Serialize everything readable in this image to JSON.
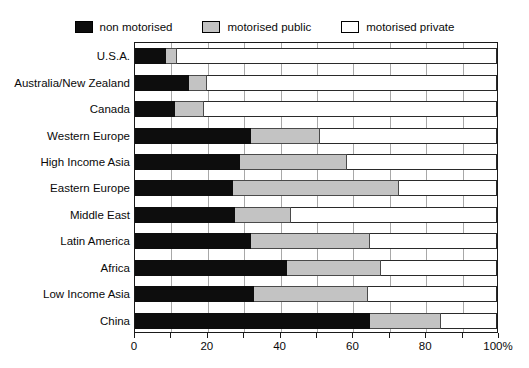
{
  "chart_data": {
    "type": "bar",
    "orientation": "horizontal",
    "stacked": true,
    "normalized_percent": true,
    "title": "",
    "subtitle": "",
    "xlabel": "",
    "ylabel": "",
    "xlim": [
      0,
      100
    ],
    "xtick_values": [
      0,
      10,
      20,
      30,
      40,
      50,
      60,
      70,
      80,
      90,
      100
    ],
    "xtick_labels": [
      "0",
      "",
      "20",
      "",
      "40",
      "",
      "60",
      "",
      "80",
      "",
      "100%"
    ],
    "grid": true,
    "grid_axis": "x",
    "legend_position": "top-center",
    "categories": [
      "U.S.A.",
      "Australia/New Zealand",
      "Canada",
      "Western Europe",
      "High Income Asia",
      "Eastern Europe",
      "Middle East",
      "Latin America",
      "Africa",
      "Low Income Asia",
      "China"
    ],
    "series": [
      {
        "name": "non motorised",
        "color": "#0d0d0d",
        "values": [
          8.5,
          15,
          11,
          32,
          29,
          27,
          27.5,
          32,
          42,
          33,
          65
        ]
      },
      {
        "name": "motorised public",
        "color": "#c3c3c3",
        "values": [
          3,
          5,
          8,
          19,
          29.5,
          46,
          15.5,
          33,
          26,
          31.5,
          19.5
        ]
      },
      {
        "name": "motorised private",
        "color": "#ffffff",
        "values": [
          88.5,
          80,
          81,
          49,
          41.5,
          27,
          57,
          35,
          32,
          35.5,
          15.5
        ]
      }
    ],
    "cumulative_stops": [
      {
        "category": "U.S.A.",
        "non_motorised_end": 8.5,
        "motorised_public_end": 11.5,
        "total": 100
      },
      {
        "category": "Australia/New Zealand",
        "non_motorised_end": 15,
        "motorised_public_end": 20,
        "total": 100
      },
      {
        "category": "Canada",
        "non_motorised_end": 11,
        "motorised_public_end": 19,
        "total": 100
      },
      {
        "category": "Western Europe",
        "non_motorised_end": 32,
        "motorised_public_end": 51,
        "total": 100
      },
      {
        "category": "High Income Asia",
        "non_motorised_end": 29,
        "motorised_public_end": 58.5,
        "total": 100
      },
      {
        "category": "Eastern Europe",
        "non_motorised_end": 27,
        "motorised_public_end": 73,
        "total": 100
      },
      {
        "category": "Middle East",
        "non_motorised_end": 27.5,
        "motorised_public_end": 43,
        "total": 100
      },
      {
        "category": "Latin America",
        "non_motorised_end": 32,
        "motorised_public_end": 65,
        "total": 100
      },
      {
        "category": "Africa",
        "non_motorised_end": 42,
        "motorised_public_end": 68,
        "total": 100
      },
      {
        "category": "Low Income Asia",
        "non_motorised_end": 33,
        "motorised_public_end": 64.5,
        "total": 100
      },
      {
        "category": "China",
        "non_motorised_end": 65,
        "motorised_public_end": 84.5,
        "total": 100
      }
    ]
  },
  "legend": {
    "entries": [
      {
        "label": "non motorised",
        "swatch": "black-swatch-icon",
        "color": "#0d0d0d"
      },
      {
        "label": "motorised public",
        "swatch": "gray-swatch-icon",
        "color": "#c3c3c3"
      },
      {
        "label": "motorised private",
        "swatch": "white-swatch-icon",
        "color": "#ffffff"
      }
    ]
  },
  "axis": {
    "x_labels": [
      "0",
      "20",
      "40",
      "60",
      "80",
      "100%"
    ],
    "x_label_values": [
      0,
      20,
      40,
      60,
      80,
      100
    ]
  },
  "colors": {
    "non_motorised": "#0d0d0d",
    "motorised_public": "#c3c3c3",
    "motorised_private": "#ffffff",
    "gridline": "#a8a8a8",
    "frame": "#1a1a1a",
    "text": "#0a0a0a",
    "background": "#ffffff"
  }
}
